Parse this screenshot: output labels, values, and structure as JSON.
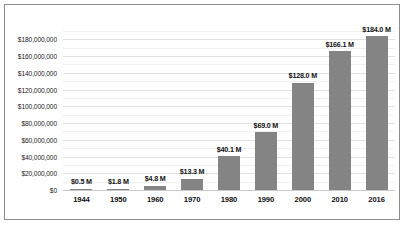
{
  "chart_data": {
    "type": "bar",
    "title": "",
    "xlabel": "",
    "ylabel": "",
    "categories": [
      "1944",
      "1950",
      "1960",
      "1970",
      "1980",
      "1990",
      "2000",
      "2010",
      "2016"
    ],
    "values": [
      500000,
      1800000,
      4800000,
      13300000,
      40100000,
      69000000,
      128000000,
      166100000,
      184000000
    ],
    "data_labels": [
      "$0.5 M",
      "$1.8 M",
      "$4.8 M",
      "$13.3 M",
      "$40.1 M",
      "$69.0 M",
      "$128.0 M",
      "$166.1 M",
      "$184.0 M"
    ],
    "ylim": [
      0,
      190000000
    ],
    "ytick_values": [
      0,
      20000000,
      40000000,
      60000000,
      80000000,
      100000000,
      120000000,
      140000000,
      160000000,
      180000000
    ],
    "ytick_labels": [
      "$0",
      "$20,000,000",
      "$40,000,000",
      "$60,000,000",
      "$80,000,000",
      "$100,000,000",
      "$120,000,000",
      "$140,000,000",
      "$160,000,000",
      "$180,000,000"
    ],
    "minor_tick_values": [
      10000000,
      30000000,
      50000000,
      70000000,
      90000000,
      110000000,
      130000000,
      150000000,
      170000000,
      190000000
    ],
    "grid": true,
    "legend": "none",
    "colors": {
      "bar_fill": "#848484",
      "gridline_major": "#e2e2e2",
      "gridline_minor": "#f0f0f0",
      "frame_border": "#8c8c8c",
      "background": "#ffffff",
      "text": "#111111"
    }
  }
}
